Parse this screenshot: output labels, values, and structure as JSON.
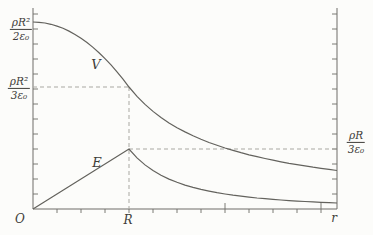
{
  "figure": {
    "background": "#fcfcfa",
    "curve_color": "#63625d",
    "axis_color": "#6e6d68",
    "dash_color": "#a9a8a2",
    "text_color": "#3e3d39"
  },
  "labels": {
    "y_top": {
      "num": "ρR²",
      "den": "2ε₀"
    },
    "y_mid": {
      "num": "ρR²",
      "den": "3ε₀"
    },
    "y_right": {
      "num": "ρR",
      "den": "3ε₀"
    },
    "curve_v": "V",
    "curve_e": "E",
    "origin": "O",
    "x_R": "R",
    "x_axis": "r"
  },
  "chart_data": {
    "type": "line",
    "title": "",
    "xlabel": "r",
    "x_axis_marks": [
      "O",
      "R"
    ],
    "y_axis_marks_left": [
      "ρR²/2ε₀",
      "ρR²/3ε₀"
    ],
    "y_axis_marks_right": [
      "ρR/3ε₀"
    ],
    "series": [
      {
        "name": "V",
        "x_over_R": [
          0,
          0.25,
          0.5,
          0.75,
          1,
          1.25,
          1.5,
          2,
          2.5,
          3,
          3.16
        ],
        "value_in_rhoR2_over_eps0": [
          0.5,
          0.49,
          0.458,
          0.406,
          0.333,
          0.267,
          0.222,
          0.167,
          0.133,
          0.111,
          0.105
        ]
      },
      {
        "name": "E",
        "x_over_R": [
          0,
          0.25,
          0.5,
          0.75,
          1,
          1.25,
          1.5,
          2,
          2.5,
          3,
          3.16
        ],
        "value_in_rhoR_over_eps0": [
          0,
          0.083,
          0.167,
          0.25,
          0.333,
          0.213,
          0.148,
          0.083,
          0.053,
          0.037,
          0.033
        ]
      }
    ],
    "key_values": {
      "V_at_0": "ρR²/2ε₀",
      "V_at_R": "ρR²/3ε₀",
      "E_at_R": "ρR/3ε₀",
      "E_at_0": 0
    },
    "guides": [
      {
        "kind": "horizontal-dashed",
        "level": "V = ρR²/3ε₀",
        "from_x": "0",
        "to_x": "R"
      },
      {
        "kind": "vertical-dashed",
        "at_x": "R",
        "from": "V curve",
        "to": "x-axis"
      },
      {
        "kind": "horizontal-dashed",
        "level": "E = ρR/3ε₀",
        "from_x": "R",
        "to_x": "right axis"
      }
    ],
    "axis_ranges": {
      "x": [
        "0",
        "≈3.2R"
      ],
      "grid": "off",
      "legend": "inline curve labels"
    }
  }
}
